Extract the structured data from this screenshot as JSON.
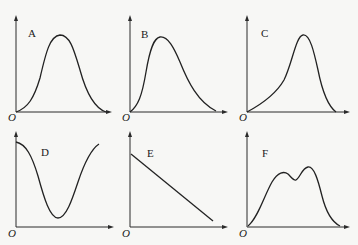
{
  "figure": {
    "origin_label": "O",
    "panels": [
      {
        "id": "A",
        "label": "A",
        "shape": "symmetric bell curve starting at origin, peak in middle, returning to zero"
      },
      {
        "id": "B",
        "label": "B",
        "shape": "right-skewed curve: steep rise to early peak, long gradual decline to zero"
      },
      {
        "id": "C",
        "label": "C",
        "shape": "left-skewed curve: gradual rise to late peak, steep decline to zero"
      },
      {
        "id": "D",
        "label": "D",
        "shape": "U-shaped curve: starts high, falls to minimum near middle, rises again"
      },
      {
        "id": "E",
        "label": "E",
        "shape": "straight line decreasing from high on y-axis toward x-axis"
      },
      {
        "id": "F",
        "label": "F",
        "shape": "bimodal curve with two peaks and a shallow dip between them"
      }
    ]
  }
}
